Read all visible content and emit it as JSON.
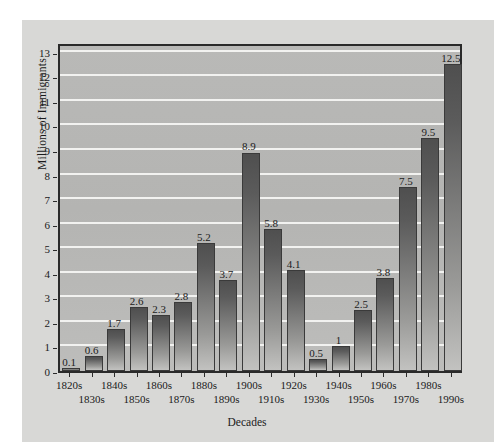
{
  "chart_data": {
    "type": "bar",
    "title": "",
    "xlabel": "Decades",
    "ylabel": "Millions of Immigrants",
    "ylim": [
      0,
      13.4
    ],
    "yticks": [
      0,
      1,
      2,
      3,
      4,
      5,
      6,
      7,
      8,
      9,
      10,
      11,
      12,
      13
    ],
    "grid": true,
    "legend": "none",
    "categories": [
      "1820s",
      "1830s",
      "1840s",
      "1850s",
      "1860s",
      "1870s",
      "1880s",
      "1890s",
      "1900s",
      "1910s",
      "1920s",
      "1930s",
      "1940s",
      "1950s",
      "1960s",
      "1970s",
      "1980s",
      "1990s"
    ],
    "values": [
      0.1,
      0.6,
      1.7,
      2.6,
      2.3,
      2.8,
      5.2,
      3.7,
      8.9,
      5.8,
      4.1,
      0.5,
      1,
      2.5,
      3.8,
      7.5,
      9.5,
      12.5
    ],
    "value_labels": [
      "0.1",
      "0.6",
      "1.7",
      "2.6",
      "2.3",
      "2.8",
      "5.2",
      "3.7",
      "8.9",
      "5.8",
      "4.1",
      "0.5",
      "1",
      "2.5",
      "3.8",
      "7.5",
      "9.5",
      "12.5"
    ],
    "series": [
      {
        "name": "Immigrants",
        "values": [
          0.1,
          0.6,
          1.7,
          2.6,
          2.3,
          2.8,
          5.2,
          3.7,
          8.9,
          5.8,
          4.1,
          0.5,
          1,
          2.5,
          3.8,
          7.5,
          9.5,
          12.5
        ]
      }
    ],
    "colors": {
      "bar_top": "#4f4f4f",
      "bar_bottom": "#c2c2c0",
      "plot_background": "#b7b7b5",
      "gridline": "#f2f2f0",
      "axis": "#2a2a2a",
      "paper": "#d8d8d6",
      "text": "#1a1a1a"
    }
  }
}
